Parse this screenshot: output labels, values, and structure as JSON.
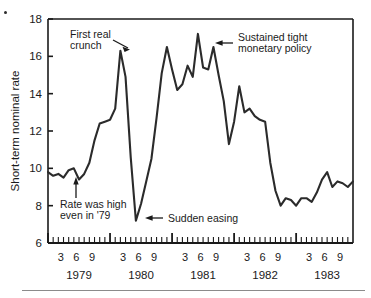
{
  "figure": {
    "name": "short-term-nominal-rate-chart",
    "background_color": "#ffffff",
    "line_color": "#2b2b2b",
    "axis_color": "#1a1a1a",
    "rule_color": "#8b8b8b"
  },
  "chart_data": {
    "type": "line",
    "title": "",
    "xlabel": "",
    "ylabel": "Short-term nominal rate",
    "ylim": [
      6,
      18
    ],
    "yticks": [
      6,
      8,
      10,
      12,
      14,
      16,
      18
    ],
    "ytick_labels": [
      "6",
      "8",
      "10",
      "12",
      "14",
      "16",
      "18"
    ],
    "xlim": [
      1979.0,
      1983.9166
    ],
    "grid": false,
    "legend": null,
    "years": [
      "1979",
      "1980",
      "1981",
      "1982",
      "1983"
    ],
    "month_tick_labels": [
      "3",
      "6",
      "9"
    ],
    "x": [
      1979.0,
      1979.0833,
      1979.1667,
      1979.25,
      1979.3333,
      1979.4167,
      1979.5,
      1979.5833,
      1979.6667,
      1979.75,
      1979.8333,
      1979.9167,
      1980.0,
      1980.0833,
      1980.1667,
      1980.25,
      1980.3333,
      1980.4167,
      1980.5,
      1980.5833,
      1980.6667,
      1980.75,
      1980.8333,
      1980.9167,
      1981.0,
      1981.0833,
      1981.1667,
      1981.25,
      1981.3333,
      1981.4167,
      1981.5,
      1981.5833,
      1981.6667,
      1981.75,
      1981.8333,
      1981.9167,
      1982.0,
      1982.0833,
      1982.1667,
      1982.25,
      1982.3333,
      1982.4167,
      1982.5,
      1982.5833,
      1982.6667,
      1982.75,
      1982.8333,
      1982.9167,
      1983.0,
      1983.0833,
      1983.1667,
      1983.25,
      1983.3333,
      1983.4167,
      1983.5,
      1983.5833,
      1983.6667,
      1983.75,
      1983.8333,
      1983.9167
    ],
    "values": [
      9.8,
      9.6,
      9.7,
      9.5,
      9.9,
      10.0,
      9.4,
      9.7,
      10.3,
      11.5,
      12.4,
      12.5,
      12.6,
      13.2,
      16.3,
      14.9,
      10.6,
      7.2,
      8.1,
      9.3,
      10.5,
      12.7,
      15.1,
      16.5,
      15.3,
      14.2,
      14.5,
      15.5,
      14.9,
      17.2,
      15.4,
      15.3,
      16.5,
      15.0,
      13.6,
      11.3,
      12.5,
      14.4,
      13.0,
      13.2,
      12.8,
      12.6,
      12.5,
      10.3,
      8.8,
      8.0,
      8.4,
      8.3,
      8.0,
      8.4,
      8.4,
      8.2,
      8.7,
      9.4,
      9.8,
      9.0,
      9.3,
      9.2,
      9.0,
      9.3
    ]
  },
  "annotations": [
    {
      "name": "annotation-first-real-crunch",
      "lines": [
        "First real",
        "crunch"
      ],
      "arrow": "down-right",
      "points_to_value": 16.3,
      "points_to_x": "1980-03"
    },
    {
      "name": "annotation-rate-was-high",
      "lines": [
        "Rate was high",
        "even in '79"
      ],
      "arrow": "up",
      "points_to_value": 9.7,
      "points_to_x": "1979-05"
    },
    {
      "name": "annotation-sudden-easing",
      "lines": [
        "Sudden easing"
      ],
      "arrow": "left",
      "points_to_value": 7.2,
      "points_to_x": "1980-06"
    },
    {
      "name": "annotation-sustained-tight-policy",
      "lines": [
        "Sustained tight",
        "monetary policy"
      ],
      "arrow": "left",
      "points_to_value": 16.5,
      "points_to_x": "1981-09"
    }
  ]
}
